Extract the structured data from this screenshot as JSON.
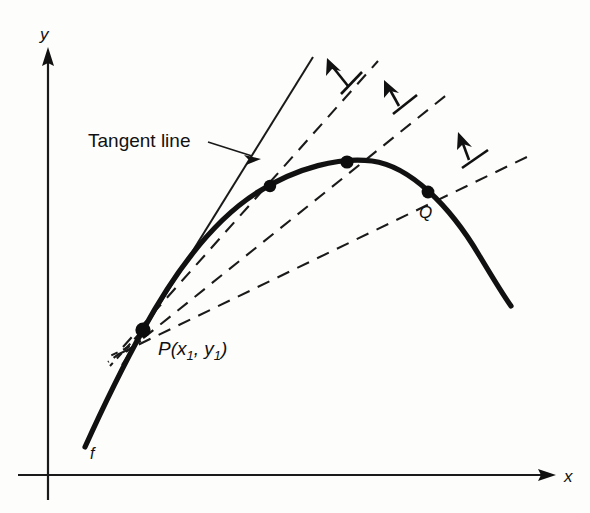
{
  "figure": {
    "type": "math-diagram",
    "background_color": "#fdfdfb",
    "ink_color": "#111111"
  },
  "axes": {
    "x_label": "x",
    "y_label": "y",
    "x_axis": {
      "x1": 18,
      "y1": 475,
      "x2": 552,
      "y2": 475,
      "arrow": "right"
    },
    "y_axis": {
      "x1": 48,
      "y1": 500,
      "x2": 48,
      "y2": 48,
      "arrow": "up"
    },
    "x_label_pos": {
      "x": 566,
      "y": 481
    },
    "y_label_pos": {
      "x": 41,
      "y": 38
    }
  },
  "curve": {
    "name": "f",
    "label": "f",
    "label_pos": {
      "x": 92,
      "y": 457
    },
    "path": "M 85,447 C 110,392 128,360 143,330 C 175,268 212,216 258,190 C 300,166 340,158 372,161 C 412,165 450,206 480,256 C 495,281 503,295 511,306",
    "stroke_width": 5.2
  },
  "tangent_line": {
    "label": "Tangent line",
    "label_pos": {
      "x": 90,
      "y": 147
    },
    "line": {
      "x1": 124,
      "y1": 364,
      "x2": 313,
      "y2": 57
    },
    "leader": {
      "x1": 209,
      "y1": 143,
      "x2": 257,
      "y2": 158
    },
    "arrowhead_at": {
      "x": 259,
      "y": 159
    },
    "style": "solid"
  },
  "point_p": {
    "label_main": "P(x",
    "sub1": "1",
    "comma": ", y",
    "sub2": "1",
    "close": ")",
    "full_label": "P(x1 , y1)",
    "position": {
      "x": 143,
      "y": 330
    },
    "label_pos": {
      "x": 160,
      "y": 352
    },
    "radius": 7.5
  },
  "point_q": {
    "label": "Q",
    "position": {
      "x": 428,
      "y": 192
    },
    "label_pos": {
      "x": 420,
      "y": 216
    },
    "radius": 6.5
  },
  "intermediate_points": [
    {
      "name": "secant-point-1",
      "x": 270,
      "y": 186,
      "radius": 6.0
    },
    {
      "name": "secant-point-2",
      "x": 347,
      "y": 162,
      "radius": 6.5
    }
  ],
  "secant_lines": [
    {
      "name": "secant-line-1",
      "note": "steepest dashed secant, through point near (270,186)",
      "line": {
        "x1": 123,
        "y1": 347,
        "x2": 377,
        "y2": 62
      },
      "stub": {
        "x1": 139,
        "y1": 334,
        "x2": 112,
        "y2": 364
      }
    },
    {
      "name": "secant-line-2",
      "note": "middle dashed secant, through point near (347,162)",
      "line": {
        "x1": 126,
        "y1": 352,
        "x2": 447,
        "y2": 94
      },
      "stub": {
        "x1": 140,
        "y1": 337,
        "x2": 110,
        "y2": 361
      }
    },
    {
      "name": "secant-line-3",
      "note": "shallow dashed secant, through Q near (428,192)",
      "line": {
        "x1": 119,
        "y1": 354,
        "x2": 531,
        "y2": 155
      },
      "stub": {
        "x1": 141,
        "y1": 341,
        "x2": 108,
        "y2": 357
      }
    }
  ],
  "rotation_arrows": [
    {
      "name": "rotation-arrow-1",
      "tip": {
        "x": 329,
        "y": 60
      },
      "tail": {
        "x": 348,
        "y": 84
      },
      "cross": {
        "x1": 340,
        "y1": 92,
        "x2": 361,
        "y2": 72
      }
    },
    {
      "name": "rotation-arrow-2",
      "tip": {
        "x": 387,
        "y": 82
      },
      "tail": {
        "x": 399,
        "y": 104
      },
      "cross": {
        "x1": 392,
        "y1": 112,
        "x2": 416,
        "y2": 94
      }
    },
    {
      "name": "rotation-arrow-3",
      "tip": {
        "x": 460,
        "y": 134
      },
      "tail": {
        "x": 469,
        "y": 158
      },
      "cross": {
        "x1": 462,
        "y1": 166,
        "x2": 487,
        "y2": 149
      }
    }
  ]
}
